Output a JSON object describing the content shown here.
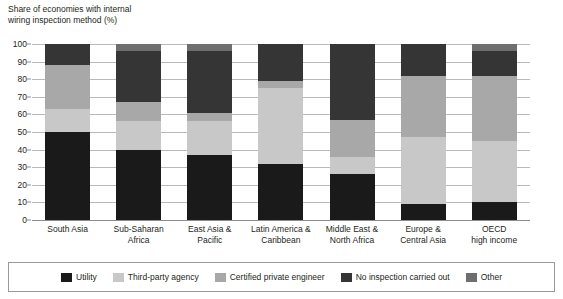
{
  "chart_data": {
    "type": "bar",
    "subtype": "stacked-bar-100",
    "title": "Share of economies with internal\nwiring inspection method (%)",
    "xlabel": "",
    "ylabel": "",
    "ylim": [
      0,
      100
    ],
    "ytick_values": [
      0,
      10,
      20,
      30,
      40,
      50,
      60,
      70,
      80,
      90,
      100
    ],
    "ytick_labels": [
      "0",
      "10",
      "20",
      "30",
      "40",
      "50",
      "60",
      "70",
      "80",
      "90",
      "100"
    ],
    "grid": true,
    "legend_position": "bottom",
    "categories": [
      "South Asia",
      "Sub-Saharan\nAfrica",
      "East Asia &\nPacific",
      "Latin America &\nCaribbean",
      "Middle East &\nNorth Africa",
      "Europe &\nCentral Asia",
      "OECD\nhigh income"
    ],
    "series": [
      {
        "name": "Utility",
        "color": "#1a1a1a",
        "values": [
          50,
          40,
          37,
          32,
          26,
          9,
          10
        ]
      },
      {
        "name": "Third-party agency",
        "color": "#c8c8c8",
        "values": [
          13,
          16,
          19,
          43,
          10,
          38,
          35
        ]
      },
      {
        "name": "Certified private engineer",
        "color": "#a8a8a8",
        "values": [
          25,
          11,
          5,
          4,
          21,
          35,
          37
        ]
      },
      {
        "name": "No inspection carried out",
        "color": "#353535",
        "values": [
          12,
          29,
          35,
          21,
          43,
          18,
          14
        ]
      },
      {
        "name": "Other",
        "color": "#6e6e6e",
        "values": [
          0,
          4,
          4,
          0,
          0,
          0,
          4
        ]
      }
    ]
  },
  "legend": {
    "items": [
      {
        "label": "Utility",
        "color": "#1a1a1a"
      },
      {
        "label": "Third-party agency",
        "color": "#c8c8c8"
      },
      {
        "label": "Certified private engineer",
        "color": "#a8a8a8"
      },
      {
        "label": "No inspection carried out",
        "color": "#353535"
      },
      {
        "label": "Other",
        "color": "#6e6e6e"
      }
    ]
  }
}
